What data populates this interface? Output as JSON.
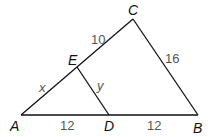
{
  "diagram": {
    "type": "triangle",
    "points": {
      "A": {
        "label": "A",
        "x": 21,
        "y": 115
      },
      "B": {
        "label": "B",
        "x": 198,
        "y": 115
      },
      "C": {
        "label": "C",
        "x": 133,
        "y": 19
      },
      "D": {
        "label": "D",
        "x": 109,
        "y": 115
      },
      "E": {
        "label": "E",
        "x": 77,
        "y": 67
      }
    },
    "segments": [
      {
        "from": "A",
        "to": "B"
      },
      {
        "from": "A",
        "to": "C"
      },
      {
        "from": "C",
        "to": "B"
      },
      {
        "from": "E",
        "to": "D"
      }
    ],
    "segment_labels": {
      "CE": "10",
      "CB": "16",
      "AE": "x",
      "ED": "y",
      "AD": "12",
      "DB": "12"
    },
    "line_color": "#111111"
  }
}
